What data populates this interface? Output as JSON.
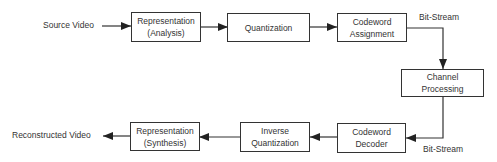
{
  "diagram": {
    "type": "video-coding-pipeline",
    "input_label": "Source Video",
    "output_label": "Reconstructed Video",
    "encoder": [
      {
        "line1": "Representation",
        "line2": "(Analysis)"
      },
      {
        "line1": "Quantization",
        "line2": ""
      },
      {
        "line1": "Codeword",
        "line2": "Assignment"
      }
    ],
    "channel": {
      "line1": "Channel",
      "line2": "Processing"
    },
    "decoder": [
      {
        "line1": "Codeword",
        "line2": "Decoder"
      },
      {
        "line1": "Inverse",
        "line2": "Quantization"
      },
      {
        "line1": "Representation",
        "line2": "(Synthesis)"
      }
    ],
    "bitstream_top": "Bit-Stream",
    "bitstream_bottom": "Bit-Stream"
  },
  "colors": {
    "stroke": "#333333",
    "background": "#ffffff"
  }
}
